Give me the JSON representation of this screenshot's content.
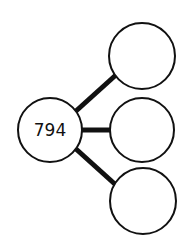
{
  "diagram": {
    "type": "number-bond",
    "center": {
      "value": "794"
    },
    "parts": [
      {
        "value": ""
      },
      {
        "value": ""
      },
      {
        "value": ""
      }
    ],
    "colors": {
      "stroke": "#111111",
      "fill": "#ffffff"
    }
  }
}
